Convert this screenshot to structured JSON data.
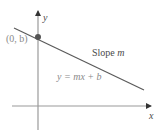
{
  "diagram": {
    "type": "slope-intercept line",
    "axes": {
      "x_label": "x",
      "y_label": "y",
      "origin": {
        "px": 38,
        "py": 106
      },
      "x_axis": {
        "x1": 12,
        "x2": 152,
        "y": 106
      },
      "y_axis": {
        "x": 38,
        "y1": 130,
        "y2": 10
      }
    },
    "line": {
      "x1": 14,
      "y1": 28,
      "x2": 144,
      "y2": 90,
      "color": "#5a5a5a"
    },
    "intercept_point": {
      "px": 38,
      "py": 37,
      "label": "(0, b)",
      "color": "#555555"
    },
    "annotations": {
      "slope_prefix": "Slope ",
      "slope_var": "m",
      "equation": "y = mx + b"
    },
    "colors": {
      "axis": "#9a9a9a",
      "arrow": "#333333",
      "line": "#5a5a5a",
      "point": "#555555"
    }
  }
}
